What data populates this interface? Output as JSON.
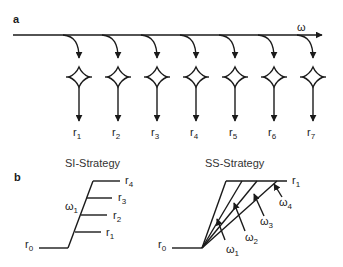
{
  "panel_a": {
    "label": "a",
    "main_axis_label": "ω",
    "columns": [
      {
        "x": 79,
        "label": "r",
        "sub": "1"
      },
      {
        "x": 118,
        "label": "r",
        "sub": "2"
      },
      {
        "x": 157,
        "label": "r",
        "sub": "3"
      },
      {
        "x": 196,
        "label": "r",
        "sub": "4"
      },
      {
        "x": 235,
        "label": "r",
        "sub": "5"
      },
      {
        "x": 274,
        "label": "r",
        "sub": "6"
      },
      {
        "x": 313,
        "label": "r",
        "sub": "7"
      }
    ]
  },
  "panel_b": {
    "label": "b",
    "si": {
      "title": "SI-Strategy",
      "base_label": "r",
      "base_sub": "0",
      "omega_label": "ω",
      "omega_sub": "1",
      "branches": [
        {
          "label": "r",
          "sub": "1"
        },
        {
          "label": "r",
          "sub": "2"
        },
        {
          "label": "r",
          "sub": "3"
        },
        {
          "label": "r",
          "sub": "4"
        }
      ]
    },
    "ss": {
      "title": "SS-Strategy",
      "base_label": "r",
      "base_sub": "0",
      "top_label": "r",
      "top_sub": "1",
      "omegas": [
        {
          "label": "ω",
          "sub": "1"
        },
        {
          "label": "ω",
          "sub": "2"
        },
        {
          "label": "ω",
          "sub": "3"
        },
        {
          "label": "ω",
          "sub": "4"
        }
      ]
    }
  },
  "colors": {
    "ink": "#1a1a1a",
    "background": "#ffffff"
  }
}
